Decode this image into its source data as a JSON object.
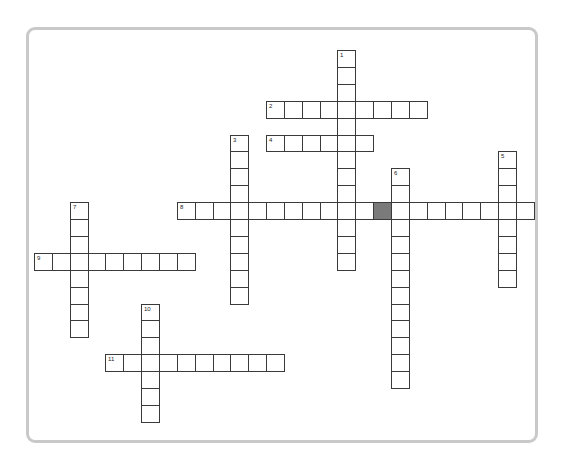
{
  "puzzle": {
    "grid": {
      "origin_x": 34,
      "origin_y": 50,
      "cell_w": 17.85,
      "cell_h": 16.9
    },
    "colors": {
      "cell_border": "#3a3a3a",
      "block": "#7a7a7a",
      "frame": "#c9c9c9"
    },
    "entries": [
      {
        "number": "1",
        "direction": "down",
        "col": 17,
        "row": 0,
        "length": 13
      },
      {
        "number": "2",
        "direction": "across",
        "col": 13,
        "row": 3,
        "length": 9
      },
      {
        "number": "3",
        "direction": "down",
        "col": 11,
        "row": 5,
        "length": 10
      },
      {
        "number": "4",
        "direction": "across",
        "col": 13,
        "row": 5,
        "length": 6
      },
      {
        "number": "5",
        "direction": "down",
        "col": 26,
        "row": 6,
        "length": 8
      },
      {
        "number": "6",
        "direction": "down",
        "col": 20,
        "row": 7,
        "length": 13
      },
      {
        "number": "7",
        "direction": "down",
        "col": 2,
        "row": 9,
        "length": 8
      },
      {
        "number": "8",
        "direction": "across",
        "col": 8,
        "row": 9,
        "length": 20
      },
      {
        "number": "9",
        "direction": "across",
        "col": 0,
        "row": 12,
        "length": 9
      },
      {
        "number": "10",
        "direction": "down",
        "col": 6,
        "row": 15,
        "length": 7
      },
      {
        "number": "11",
        "direction": "across",
        "col": 4,
        "row": 18,
        "length": 10
      }
    ],
    "blocks": [
      {
        "col": 19,
        "row": 9
      }
    ]
  }
}
